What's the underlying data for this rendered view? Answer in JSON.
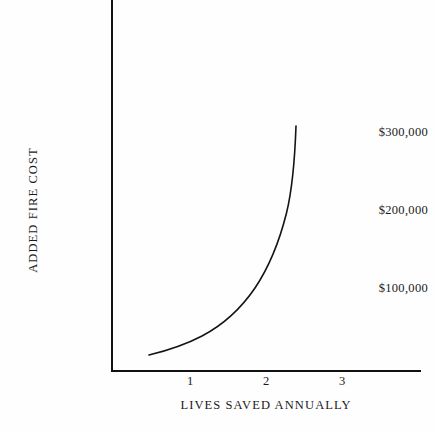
{
  "chart_data": {
    "type": "line",
    "title": "",
    "xlabel": "LIVES SAVED ANNUALLY",
    "ylabel": "ADDED FIRE COST",
    "xlim": [
      0,
      4.05
    ],
    "ylim": [
      0,
      390000
    ],
    "grid": false,
    "legend": null,
    "xtick_labels": [
      "1",
      "2",
      "3"
    ],
    "xtick_values": [
      1,
      2,
      3
    ],
    "ytick_labels": [
      "$100,000",
      "$200,000",
      "$300,000"
    ],
    "ytick_values": [
      100000,
      200000,
      300000
    ],
    "series": [
      {
        "name": "Added fire cost",
        "x": [
          0.48,
          0.7,
          0.9,
          1.1,
          1.3,
          1.5,
          1.7,
          1.9,
          2.1,
          2.25,
          2.39
        ],
        "values": [
          20000,
          36000,
          51000,
          68000,
          86000,
          107000,
          133000,
          167000,
          213000,
          255000,
          307000
        ]
      }
    ]
  },
  "axes": {
    "y_title": "ADDED FIRE COST",
    "x_title": "LIVES SAVED ANNUALLY",
    "y_ticks": [
      {
        "label": "$300,000",
        "top": 126
      },
      {
        "label": "$200,000",
        "top": 204
      },
      {
        "label": "$100,000",
        "top": 282
      }
    ],
    "x_ticks": [
      {
        "label": "1",
        "left": 190
      },
      {
        "label": "2",
        "left": 266
      },
      {
        "label": "3",
        "left": 342
      }
    ]
  },
  "curve": {
    "path": "M 149.0 355.0 C 168.0 350.4 186.0 344.4 202.0 336.0 C 222.0 325.5 240.0 310.0 255.0 288.0 C 268.0 268.6 279.0 243.0 286.5 213.0 C 292.0 190.6 294.8 160.0 296.0 126.0"
  },
  "colors": {
    "ink": "#141414",
    "background": "#fefefe"
  }
}
